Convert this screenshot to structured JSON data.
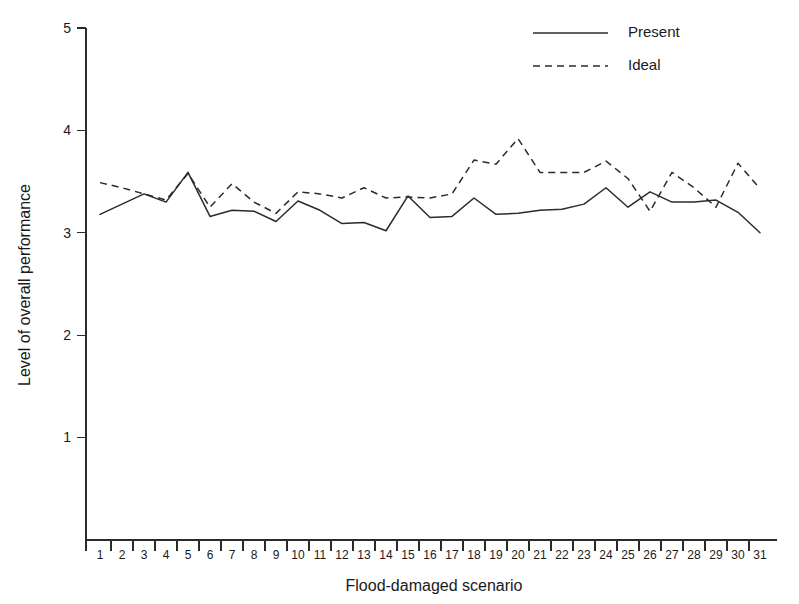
{
  "chart_data": {
    "type": "line",
    "title": "",
    "xlabel": "Flood-damaged scenario",
    "ylabel": "Level of overall performance",
    "xlim": [
      0.5,
      31.5
    ],
    "ylim": [
      0,
      5
    ],
    "yticks": [
      1,
      2,
      3,
      4,
      5
    ],
    "grid": false,
    "legend_position": "top-right",
    "categories": [
      1,
      2,
      3,
      4,
      5,
      6,
      7,
      8,
      9,
      10,
      11,
      12,
      13,
      14,
      15,
      16,
      17,
      18,
      19,
      20,
      21,
      22,
      23,
      24,
      25,
      26,
      27,
      28,
      29,
      30,
      31
    ],
    "series": [
      {
        "name": "Present",
        "style": "solid",
        "color": "#2b2b2b",
        "values": [
          3.18,
          3.28,
          3.38,
          3.3,
          3.59,
          3.16,
          3.22,
          3.21,
          3.11,
          3.31,
          3.22,
          3.09,
          3.1,
          3.02,
          3.36,
          3.15,
          3.16,
          3.34,
          3.18,
          3.19,
          3.22,
          3.23,
          3.28,
          3.44,
          3.25,
          3.4,
          3.3,
          3.3,
          3.32,
          3.2,
          3.0
        ]
      },
      {
        "name": "Ideal",
        "style": "dashed",
        "color": "#2b2b2b",
        "values": [
          3.49,
          3.44,
          3.38,
          3.32,
          3.58,
          3.25,
          3.48,
          3.3,
          3.19,
          3.4,
          3.38,
          3.34,
          3.44,
          3.34,
          3.35,
          3.34,
          3.38,
          3.71,
          3.67,
          3.92,
          3.59,
          3.59,
          3.59,
          3.7,
          3.53,
          3.21,
          3.59,
          3.44,
          3.25,
          3.68,
          3.43
        ]
      }
    ]
  },
  "legend": {
    "entries": [
      {
        "label": "Present",
        "style": "solid"
      },
      {
        "label": "Ideal",
        "style": "dashed"
      }
    ]
  },
  "axes": {
    "y_title": "Level of overall performance",
    "x_title": "Flood-damaged scenario",
    "y_tick_labels": [
      "5",
      "4",
      "3",
      "2",
      "1"
    ],
    "x_tick_labels": [
      "1",
      "2",
      "3",
      "4",
      "5",
      "6",
      "7",
      "8",
      "9",
      "10",
      "11",
      "12",
      "13",
      "14",
      "15",
      "16",
      "17",
      "18",
      "19",
      "20",
      "21",
      "22",
      "23",
      "24",
      "25",
      "26",
      "27",
      "28",
      "29",
      "30",
      "31"
    ]
  }
}
